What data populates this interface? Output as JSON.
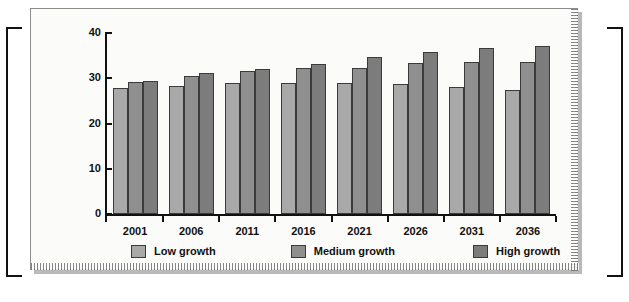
{
  "figure": {
    "background_color": "#fbfbfa",
    "frame_color": "#8d8d8d"
  },
  "chart_data": {
    "type": "bar",
    "title": "",
    "subtitle": "",
    "xlabel": "",
    "ylabel": "",
    "categories": [
      "2001",
      "2006",
      "2011",
      "2016",
      "2021",
      "2026",
      "2031",
      "2036"
    ],
    "ylim": [
      0,
      40
    ],
    "yticks": [
      0,
      10,
      20,
      30,
      40
    ],
    "ytick_labels": [
      "0",
      "10",
      "20",
      "30",
      "40"
    ],
    "grid": false,
    "legend_position": "bottom",
    "series": [
      {
        "name": "Low growth",
        "color": "#a9a9a9",
        "values": [
          27.8,
          28.3,
          28.9,
          28.9,
          29.0,
          28.8,
          28.1,
          27.4
        ]
      },
      {
        "name": "Medium growth",
        "color": "#8f8f8f",
        "values": [
          29.1,
          30.6,
          31.6,
          32.2,
          32.3,
          33.4,
          33.7,
          33.5
        ]
      },
      {
        "name": "High growth",
        "color": "#7c7c7c",
        "values": [
          29.4,
          31.1,
          32.1,
          33.2,
          34.7,
          35.9,
          36.6,
          37.2
        ]
      }
    ],
    "annotations": []
  },
  "legend": {
    "items": [
      {
        "label": "Low growth",
        "color": "#a9a9a9"
      },
      {
        "label": "Medium growth",
        "color": "#8f8f8f"
      },
      {
        "label": "High growth",
        "color": "#7c7c7c"
      }
    ]
  }
}
